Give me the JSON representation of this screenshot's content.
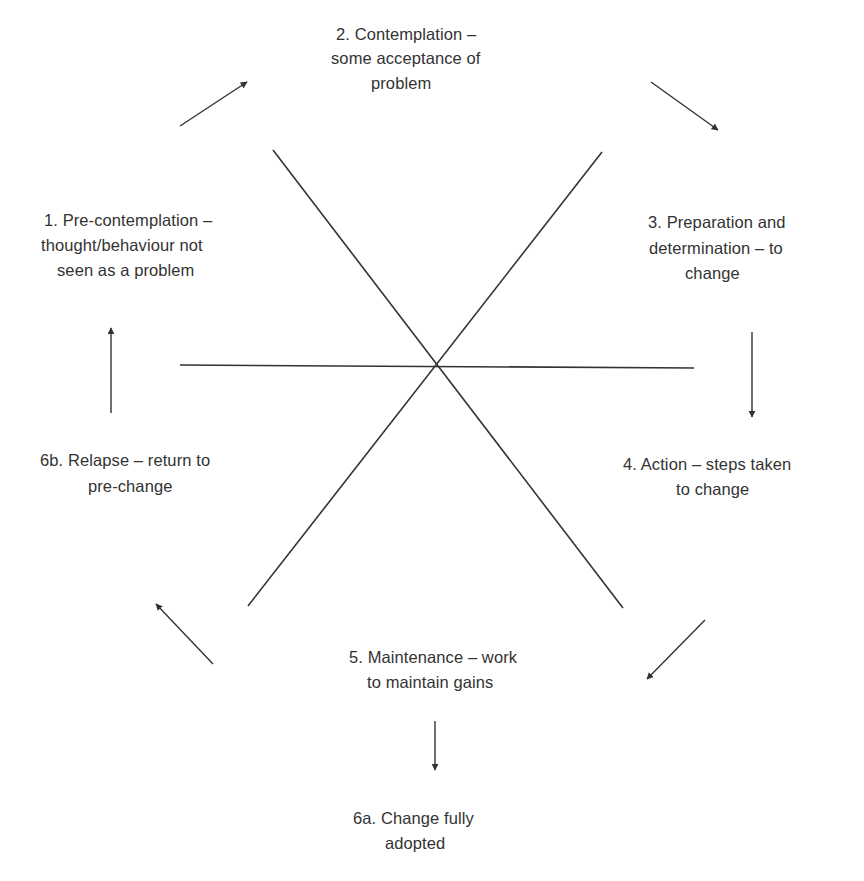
{
  "diagram": {
    "type": "stages-of-change cycle",
    "colors": {
      "background": "#ffffff",
      "ink": "#333333"
    },
    "center": {
      "x": 437,
      "y": 365
    },
    "spokes": [
      {
        "name": "horizontal-spoke",
        "x1": 180,
        "y1": 365,
        "x2": 694,
        "y2": 368
      },
      {
        "name": "diagonal-spoke-nw-se",
        "x1": 273,
        "y1": 150,
        "x2": 623,
        "y2": 608
      },
      {
        "name": "diagonal-spoke-ne-sw",
        "x1": 602,
        "y1": 152,
        "x2": 248,
        "y2": 606
      }
    ],
    "arrows": [
      {
        "name": "arrow-1-to-2",
        "from": "stage-1",
        "to": "stage-2",
        "x1": 180,
        "y1": 126,
        "x2": 247,
        "y2": 82
      },
      {
        "name": "arrow-2-to-3",
        "from": "stage-2",
        "to": "stage-3",
        "x1": 651,
        "y1": 82,
        "x2": 718,
        "y2": 130
      },
      {
        "name": "arrow-3-to-4",
        "from": "stage-3",
        "to": "stage-4",
        "x1": 752,
        "y1": 332,
        "x2": 752,
        "y2": 417
      },
      {
        "name": "arrow-4-to-5",
        "from": "stage-4",
        "to": "stage-5",
        "x1": 705,
        "y1": 620,
        "x2": 647,
        "y2": 679
      },
      {
        "name": "arrow-5-to-6a",
        "from": "stage-5",
        "to": "stage-6a",
        "x1": 435,
        "y1": 721,
        "x2": 435,
        "y2": 770
      },
      {
        "name": "arrow-5-to-6b",
        "from": "stage-5",
        "to": "stage-6b",
        "x1": 213,
        "y1": 664,
        "x2": 156,
        "y2": 604
      },
      {
        "name": "arrow-6b-to-1",
        "from": "stage-6b",
        "to": "stage-1",
        "x1": 111,
        "y1": 413,
        "x2": 111,
        "y2": 328
      }
    ],
    "stages": [
      {
        "id": "stage-1",
        "title": "1. Pre-contemplation – thought/behaviour not seen as a problem",
        "lines": [
          "1. Pre-contemplation –",
          "thought/behaviour not",
          "seen as a problem"
        ],
        "line_pos": [
          [
            44,
            208
          ],
          [
            41,
            233
          ],
          [
            57,
            258
          ]
        ]
      },
      {
        "id": "stage-2",
        "title": "2. Contemplation – some acceptance of problem",
        "lines": [
          "2. Contemplation –",
          "some acceptance of",
          "problem"
        ],
        "line_pos": [
          [
            336,
            22
          ],
          [
            331,
            46
          ],
          [
            371,
            71
          ]
        ]
      },
      {
        "id": "stage-3",
        "title": "3. Preparation and determination – to change",
        "lines": [
          "3. Preparation and",
          "determination – to",
          "change"
        ],
        "line_pos": [
          [
            648,
            210
          ],
          [
            649,
            236
          ],
          [
            685,
            261
          ]
        ]
      },
      {
        "id": "stage-4",
        "title": "4. Action – steps taken to change",
        "lines": [
          "4. Action – steps taken",
          "to change"
        ],
        "line_pos": [
          [
            623,
            452
          ],
          [
            676,
            477
          ]
        ]
      },
      {
        "id": "stage-5",
        "title": "5. Maintenance – work to maintain gains",
        "lines": [
          "5. Maintenance – work",
          "to maintain gains"
        ],
        "line_pos": [
          [
            349,
            645
          ],
          [
            367,
            670
          ]
        ]
      },
      {
        "id": "stage-6a",
        "title": "6a. Change fully adopted",
        "lines": [
          "6a. Change fully",
          "adopted"
        ],
        "line_pos": [
          [
            353,
            806
          ],
          [
            385,
            831
          ]
        ]
      },
      {
        "id": "stage-6b",
        "title": "6b. Relapse – return to pre-change",
        "lines": [
          "6b. Relapse – return to",
          "pre-change"
        ],
        "line_pos": [
          [
            40,
            448
          ],
          [
            88,
            474
          ]
        ]
      }
    ]
  }
}
